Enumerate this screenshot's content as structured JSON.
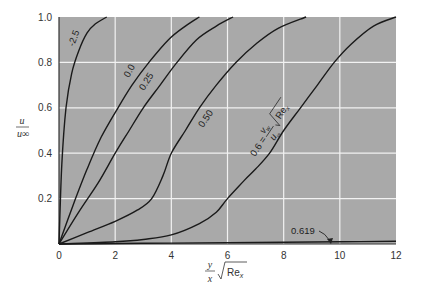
{
  "chart_data": {
    "type": "line",
    "title": "",
    "xlabel": "y/x √Re_x",
    "ylabel": "u/u∞",
    "xlim": [
      0,
      12
    ],
    "ylim": [
      0,
      1.0
    ],
    "grid": true,
    "xticks": [
      "0",
      "2",
      "4",
      "6",
      "8",
      "10",
      "12"
    ],
    "yticks": [
      "0.2",
      "0.4",
      "0.6",
      "0.8",
      "1.0"
    ],
    "parameter_label": "0.6 = (v_w/u∞) √Re_x",
    "series": [
      {
        "name": "-2.5",
        "x": [
          0,
          0.1,
          0.25,
          0.45,
          0.7,
          1.0,
          1.3,
          1.7
        ],
        "y": [
          0,
          0.35,
          0.6,
          0.75,
          0.85,
          0.93,
          0.97,
          1.0
        ]
      },
      {
        "name": "0.0",
        "x": [
          0,
          0.5,
          1.0,
          1.5,
          2.1,
          2.6,
          3.2,
          3.9,
          4.5,
          5.0
        ],
        "y": [
          0,
          0.17,
          0.33,
          0.47,
          0.6,
          0.7,
          0.8,
          0.9,
          0.96,
          1.0
        ]
      },
      {
        "name": "0.25",
        "x": [
          0,
          0.7,
          1.4,
          2.0,
          2.5,
          3.0,
          3.6,
          4.2,
          4.9,
          5.6,
          6.2
        ],
        "y": [
          0,
          0.14,
          0.27,
          0.4,
          0.5,
          0.6,
          0.7,
          0.8,
          0.9,
          0.96,
          1.0
        ]
      },
      {
        "name": "0.50",
        "x": [
          0,
          1.0,
          2.0,
          2.8,
          3.3,
          3.7,
          4.0,
          4.5,
          5.0,
          5.6,
          6.3,
          7.0,
          7.8,
          8.8
        ],
        "y": [
          0,
          0.05,
          0.1,
          0.15,
          0.2,
          0.3,
          0.4,
          0.5,
          0.6,
          0.7,
          0.8,
          0.88,
          0.95,
          1.0
        ]
      },
      {
        "name": "0.6",
        "x": [
          0,
          2.0,
          3.0,
          4.0,
          5.0,
          5.6,
          6.0,
          6.6,
          7.0,
          7.5,
          8.0,
          8.6,
          9.2,
          9.8,
          10.4,
          11.2,
          12.0
        ],
        "y": [
          0,
          0.01,
          0.02,
          0.04,
          0.09,
          0.14,
          0.2,
          0.28,
          0.33,
          0.4,
          0.5,
          0.6,
          0.7,
          0.8,
          0.88,
          0.96,
          1.0
        ]
      },
      {
        "name": "0.619",
        "x": [
          0,
          2,
          4,
          6,
          8,
          10,
          12
        ],
        "y": [
          0,
          0.002,
          0.004,
          0.006,
          0.008,
          0.01,
          0.012
        ]
      }
    ],
    "annotations": [
      {
        "text": "-2.5",
        "x": 0.45,
        "y": 0.88,
        "rotate": -70
      },
      {
        "text": "0.0",
        "x": 2.55,
        "y": 0.72,
        "rotate": -62
      },
      {
        "text": "0.25",
        "x": 3.1,
        "y": 0.68,
        "rotate": -58
      },
      {
        "text": "0.50",
        "x": 5.0,
        "y": 0.48,
        "rotate": -56
      },
      {
        "text": "0.6 = (v_w/u∞) √Re_x",
        "x": 7.3,
        "y": 0.4,
        "rotate": -55
      },
      {
        "text": "0.619",
        "x": 8.0,
        "y": 0.07,
        "arrow_to_x": 9.6,
        "arrow_to_y": 0.0
      }
    ]
  },
  "labels": {
    "ylabel_num": "u",
    "ylabel_den": "u∞",
    "xlabel_num": "y",
    "xlabel_den": "x",
    "xlabel_root": "Re",
    "xlabel_sub": "x",
    "param_eq_prefix": "0.6 =",
    "param_num": "v",
    "param_num_sub": "w",
    "param_den": "u",
    "param_den_sub": "∞",
    "param_root": "Re",
    "param_root_sub": "x",
    "c_m25": "-2.5",
    "c_00": "0.0",
    "c_025": "0.25",
    "c_050": "0.50",
    "c_0619": "0.619"
  },
  "colors": {
    "plot_bg": "#a9a9a9",
    "grid": "#f2f2f2",
    "curve": "#1a1a1a",
    "text": "#333333"
  }
}
